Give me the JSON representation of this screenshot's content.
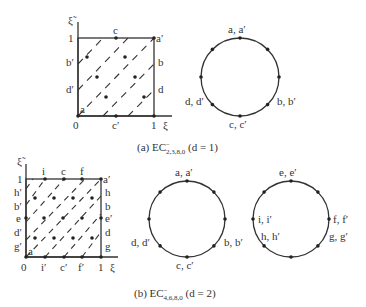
{
  "figure": {
    "panel_a": {
      "caption": {
        "prefix": "(a) EC",
        "superscript": "−",
        "subscript": "2,3,8,0",
        "suffix": " (d = 1)"
      },
      "square": {
        "axis_x_label": "ξ",
        "axis_y_label": "ξ̃",
        "tick_labels": {
          "origin": "0",
          "x_one": "1",
          "y_one": "1"
        },
        "top_labels": [
          "c"
        ],
        "bottom_labels": [
          "c′"
        ],
        "left_labels": [
          "b′",
          "d′"
        ],
        "right_labels": [
          "b",
          "d"
        ],
        "corner_labels": {
          "top_right": "a′",
          "bottom_left": "a"
        }
      },
      "circle": {
        "labels": {
          "top": "a, a′",
          "bottom": "c, c′",
          "lower_left": "d, d′",
          "lower_right": "b, b′"
        }
      }
    },
    "panel_b": {
      "caption": {
        "prefix": "(b) EC",
        "superscript": "−",
        "subscript": "4,6,8,0",
        "suffix": " (d = 2)"
      },
      "square": {
        "axis_x_label": "ξ",
        "axis_y_label": "ξ̃",
        "tick_labels": {
          "origin": "0",
          "x_one": "1",
          "y_one": "1"
        },
        "top_labels": [
          "i",
          "c",
          "f"
        ],
        "bottom_labels": [
          "i′",
          "c′",
          "f′"
        ],
        "left_labels": [
          "h′",
          "b′",
          "e",
          "d′",
          "g′"
        ],
        "right_labels": [
          "h",
          "b",
          "e′",
          "d",
          "g"
        ],
        "corner_labels": {
          "top_right": "a′",
          "bottom_left": "a"
        }
      },
      "circle_left": {
        "labels": {
          "top": "a, a′",
          "bottom": "c, c′",
          "lower_left": "d, d′",
          "lower_right": "b, b′"
        }
      },
      "circle_right": {
        "labels": {
          "top": "e, e′",
          "left": "i, i′",
          "lower_left": "h, h′",
          "right": "f, f′",
          "lower_right": "g, g′"
        }
      }
    }
  }
}
